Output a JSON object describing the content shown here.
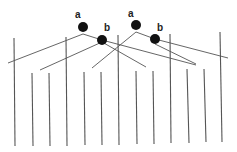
{
  "diagram": {
    "labels": [
      {
        "text": "a",
        "x": 77,
        "y": 18
      },
      {
        "text": "b",
        "x": 104,
        "y": 31
      },
      {
        "text": "a",
        "x": 130,
        "y": 17
      },
      {
        "text": "b",
        "x": 158,
        "y": 31
      }
    ],
    "nodes": [
      {
        "id": "a1",
        "x": 83,
        "y": 27,
        "r": 5
      },
      {
        "id": "b1",
        "x": 102,
        "y": 40,
        "r": 5
      },
      {
        "id": "a2",
        "x": 136,
        "y": 25,
        "r": 5
      },
      {
        "id": "b2",
        "x": 155,
        "y": 39,
        "r": 5
      }
    ],
    "colors": {
      "line": "#444444",
      "node": "#111111",
      "background": "#ffffff"
    }
  }
}
